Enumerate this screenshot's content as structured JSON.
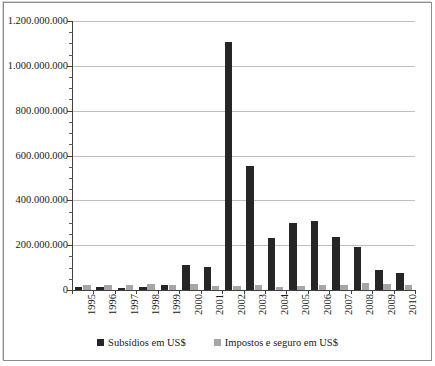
{
  "chart_data": {
    "type": "bar",
    "title": "",
    "xlabel": "",
    "ylabel": "",
    "grid": true,
    "legend_position": "bottom",
    "ylim": [
      0,
      1200000000
    ],
    "ytick_step": 200000000,
    "yminor_step": 50000000,
    "categories": [
      "1995",
      "1996",
      "1997",
      "1998",
      "1999",
      "2000",
      "2001",
      "2002",
      "2003",
      "2004",
      "2005",
      "2006",
      "2007",
      "2008",
      "2009",
      "2010"
    ],
    "ytick_labels": [
      "0",
      "200.000.000",
      "400.000.000",
      "600.000.000",
      "800.000.000",
      "1.000.000.000",
      "1.200.000.000"
    ],
    "series": [
      {
        "name": "Subsídios em US$",
        "color": "#262626",
        "values": [
          15000000,
          14000000,
          11000000,
          13000000,
          22000000,
          113000000,
          103000000,
          1105000000,
          555000000,
          232000000,
          300000000,
          310000000,
          235000000,
          190000000,
          90000000,
          75000000
        ]
      },
      {
        "name": "Impostos e seguro em US$",
        "color": "#a6a6a6",
        "values": [
          24000000,
          24000000,
          24000000,
          26000000,
          22000000,
          25000000,
          20000000,
          20000000,
          22000000,
          15000000,
          20000000,
          22000000,
          24000000,
          33000000,
          26000000,
          24000000
        ]
      }
    ]
  },
  "legend": {
    "items": [
      {
        "label": "Subsídios em US$",
        "color": "#262626"
      },
      {
        "label": "Impostos e seguro em US$",
        "color": "#a6a6a6"
      }
    ]
  }
}
